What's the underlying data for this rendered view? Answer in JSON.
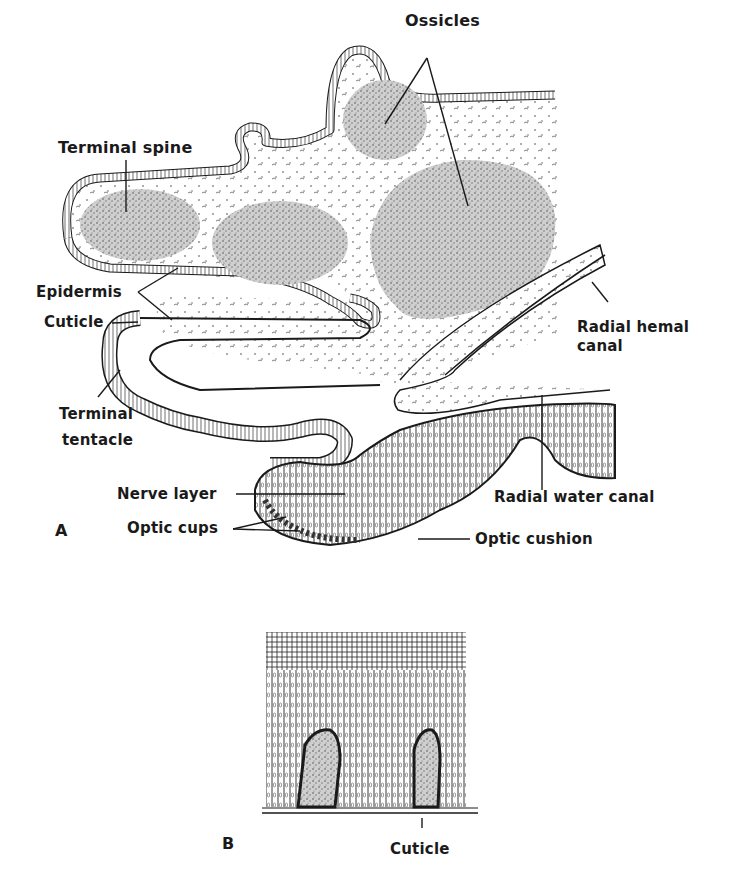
{
  "figure": {
    "panel_a": {
      "letter": "A",
      "labels": {
        "ossicles": "Ossicles",
        "terminal_spine": "Terminal spine",
        "epidermis": "Epidermis",
        "cuticle": "Cuticle",
        "radial_hemal_canal_1": "Radial hemal",
        "radial_hemal_canal_2": "canal",
        "terminal_tentacle_1": "Terminal",
        "terminal_tentacle_2": "tentacle",
        "nerve_layer": "Nerve layer",
        "radial_water_canal": "Radial water canal",
        "optic_cups": "Optic cups",
        "optic_cushion": "Optic cushion"
      }
    },
    "panel_b": {
      "letter": "B",
      "labels": {
        "cuticle": "Cuticle"
      }
    },
    "colors": {
      "ink": "#1a1a1a",
      "stipple": "#9a9a9a",
      "background": "#ffffff"
    }
  }
}
